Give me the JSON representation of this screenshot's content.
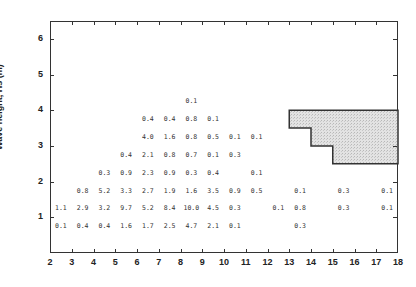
{
  "chart_data": {
    "type": "table",
    "title": "",
    "xlabel": "",
    "ylabel": "Wave height, Hs (m)",
    "xlim": [
      2,
      18
    ],
    "ylim": [
      0,
      6.5
    ],
    "x_ticks": [
      "2",
      "3",
      "4",
      "5",
      "6",
      "7",
      "8",
      "9",
      "10",
      "11",
      "12",
      "13",
      "14",
      "15",
      "16",
      "17",
      "18"
    ],
    "y_ticks": [
      "1",
      "2",
      "3",
      "4",
      "5",
      "6"
    ],
    "cells": [
      {
        "x": 8.5,
        "y": 4.25,
        "v": "0.1"
      },
      {
        "x": 6.5,
        "y": 3.75,
        "v": "0.4"
      },
      {
        "x": 7.5,
        "y": 3.75,
        "v": "0.4"
      },
      {
        "x": 8.5,
        "y": 3.75,
        "v": "0.8"
      },
      {
        "x": 9.5,
        "y": 3.75,
        "v": "0.1"
      },
      {
        "x": 6.5,
        "y": 3.25,
        "v": "4.0"
      },
      {
        "x": 7.5,
        "y": 3.25,
        "v": "1.6"
      },
      {
        "x": 8.5,
        "y": 3.25,
        "v": "0.8"
      },
      {
        "x": 9.5,
        "y": 3.25,
        "v": "0.5"
      },
      {
        "x": 10.5,
        "y": 3.25,
        "v": "0.1"
      },
      {
        "x": 11.5,
        "y": 3.25,
        "v": "0.1"
      },
      {
        "x": 5.5,
        "y": 2.75,
        "v": "0.4"
      },
      {
        "x": 6.5,
        "y": 2.75,
        "v": "2.1"
      },
      {
        "x": 7.5,
        "y": 2.75,
        "v": "0.8"
      },
      {
        "x": 8.5,
        "y": 2.75,
        "v": "0.7"
      },
      {
        "x": 9.5,
        "y": 2.75,
        "v": "0.1"
      },
      {
        "x": 10.5,
        "y": 2.75,
        "v": "0.3"
      },
      {
        "x": 4.5,
        "y": 2.25,
        "v": "0.3"
      },
      {
        "x": 5.5,
        "y": 2.25,
        "v": "0.9"
      },
      {
        "x": 6.5,
        "y": 2.25,
        "v": "2.3"
      },
      {
        "x": 7.5,
        "y": 2.25,
        "v": "0.9"
      },
      {
        "x": 8.5,
        "y": 2.25,
        "v": "0.3"
      },
      {
        "x": 9.5,
        "y": 2.25,
        "v": "0.4"
      },
      {
        "x": 11.5,
        "y": 2.25,
        "v": "0.1"
      },
      {
        "x": 3.5,
        "y": 1.75,
        "v": "0.8"
      },
      {
        "x": 4.5,
        "y": 1.75,
        "v": "5.2"
      },
      {
        "x": 5.5,
        "y": 1.75,
        "v": "3.3"
      },
      {
        "x": 6.5,
        "y": 1.75,
        "v": "2.7"
      },
      {
        "x": 7.5,
        "y": 1.75,
        "v": "1.9"
      },
      {
        "x": 8.5,
        "y": 1.75,
        "v": "1.6"
      },
      {
        "x": 9.5,
        "y": 1.75,
        "v": "3.5"
      },
      {
        "x": 10.5,
        "y": 1.75,
        "v": "0.9"
      },
      {
        "x": 11.5,
        "y": 1.75,
        "v": "0.5"
      },
      {
        "x": 13.5,
        "y": 1.75,
        "v": "0.1"
      },
      {
        "x": 15.5,
        "y": 1.75,
        "v": "0.3"
      },
      {
        "x": 17.5,
        "y": 1.75,
        "v": "0.1"
      },
      {
        "x": 2.5,
        "y": 1.25,
        "v": "1.1"
      },
      {
        "x": 3.5,
        "y": 1.25,
        "v": "2.9"
      },
      {
        "x": 4.5,
        "y": 1.25,
        "v": "3.2"
      },
      {
        "x": 5.5,
        "y": 1.25,
        "v": "9.7"
      },
      {
        "x": 6.5,
        "y": 1.25,
        "v": "5.2"
      },
      {
        "x": 7.5,
        "y": 1.25,
        "v": "8.4"
      },
      {
        "x": 8.5,
        "y": 1.25,
        "v": "10.0"
      },
      {
        "x": 9.5,
        "y": 1.25,
        "v": "4.5"
      },
      {
        "x": 10.5,
        "y": 1.25,
        "v": "0.3"
      },
      {
        "x": 12.5,
        "y": 1.25,
        "v": "0.1"
      },
      {
        "x": 13.5,
        "y": 1.25,
        "v": "0.8"
      },
      {
        "x": 15.5,
        "y": 1.25,
        "v": "0.3"
      },
      {
        "x": 17.5,
        "y": 1.25,
        "v": "0.1"
      },
      {
        "x": 2.5,
        "y": 0.75,
        "v": "0.1"
      },
      {
        "x": 3.5,
        "y": 0.75,
        "v": "0.4"
      },
      {
        "x": 4.5,
        "y": 0.75,
        "v": "0.4"
      },
      {
        "x": 5.5,
        "y": 0.75,
        "v": "1.6"
      },
      {
        "x": 6.5,
        "y": 0.75,
        "v": "1.7"
      },
      {
        "x": 7.5,
        "y": 0.75,
        "v": "2.5"
      },
      {
        "x": 8.5,
        "y": 0.75,
        "v": "4.7"
      },
      {
        "x": 9.5,
        "y": 0.75,
        "v": "2.1"
      },
      {
        "x": 10.5,
        "y": 0.75,
        "v": "0.1"
      },
      {
        "x": 13.5,
        "y": 0.75,
        "v": "0.3"
      }
    ],
    "shaded_region": {
      "description": "stepped shaded area, upper right",
      "points": [
        [
          13,
          4.0
        ],
        [
          18,
          4.0
        ],
        [
          18,
          2.5
        ],
        [
          15,
          2.5
        ],
        [
          15,
          3.0
        ],
        [
          14,
          3.0
        ],
        [
          14,
          3.5
        ],
        [
          13,
          3.5
        ]
      ],
      "fill": "#d9d9d9",
      "stroke": "#333333"
    },
    "grid": false,
    "legend": null
  }
}
